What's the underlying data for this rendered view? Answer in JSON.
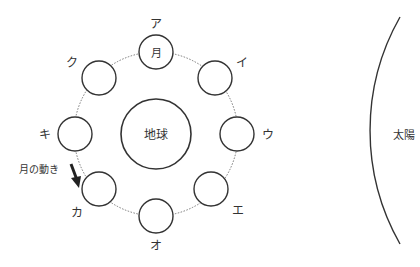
{
  "diagram": {
    "earth_label": "地球",
    "sun_label": "太陽",
    "moon_label": "月",
    "motion_label": "月の動き",
    "positions": [
      {
        "id": "ア",
        "label": "ア"
      },
      {
        "id": "イ",
        "label": "イ"
      },
      {
        "id": "ウ",
        "label": "ウ"
      },
      {
        "id": "エ",
        "label": "エ"
      },
      {
        "id": "オ",
        "label": "オ"
      },
      {
        "id": "カ",
        "label": "カ"
      },
      {
        "id": "キ",
        "label": "キ"
      },
      {
        "id": "ク",
        "label": "ク"
      }
    ]
  }
}
